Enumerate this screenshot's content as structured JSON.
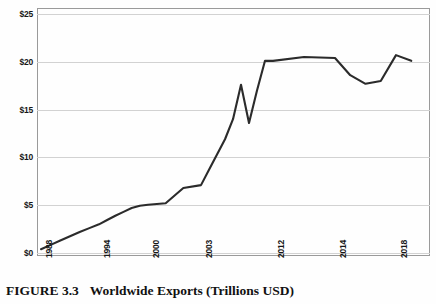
{
  "caption": {
    "figure_number": "FIGURE 3.3",
    "title": "Worldwide Exports (Trillions USD)"
  },
  "axes": {
    "y_ticks": [
      "$0",
      "$5",
      "$10",
      "$15",
      "$20",
      "$25"
    ],
    "x_ticks": [
      "1988",
      "1994",
      "2000",
      "2003",
      "2012",
      "2014",
      "2018"
    ]
  },
  "colors": {
    "line": "#2b2b2b",
    "grid": "#d2d2d2",
    "frame": "#9a9a9a",
    "text": "#161616",
    "background": "#fefefe"
  },
  "chart_data": {
    "type": "line",
    "title": "Worldwide Exports (Trillions USD)",
    "xlabel": "",
    "ylabel": "",
    "ylim": [
      0,
      25
    ],
    "xlim": [
      1988,
      2019
    ],
    "grid": true,
    "legend": false,
    "y_tick_values": [
      0,
      5,
      10,
      15,
      20,
      25
    ],
    "y_tick_labels": [
      "$0",
      "$5",
      "$10",
      "$15",
      "$20",
      "$25"
    ],
    "x_tick_values": [
      1988,
      1994,
      2000,
      2003,
      2012,
      2014,
      2018
    ],
    "x_tick_labels": [
      "1988",
      "1994",
      "2000",
      "2003",
      "2012",
      "2014",
      "2018"
    ],
    "series": [
      {
        "name": "Worldwide Exports",
        "x": [
          1988,
          1989,
          1990,
          1991,
          1992,
          1993,
          1994,
          1995,
          1996,
          1997,
          1998,
          1999,
          2000,
          2001,
          2002,
          2003,
          2004,
          2005,
          2006,
          2007,
          2008,
          2009,
          2010,
          2011,
          2012,
          2013,
          2014,
          2015,
          2016,
          2017,
          2018,
          2019
        ],
        "values": [
          0.4,
          0.85,
          1.3,
          1.75,
          2.2,
          2.6,
          3.0,
          3.45,
          3.9,
          4.3,
          4.7,
          4.95,
          5.05,
          5.2,
          6.8,
          7.1,
          8.7,
          10.3,
          11.9,
          14.0,
          17.6,
          13.6,
          17.0,
          20.1,
          20.1,
          20.5,
          20.4,
          18.6,
          17.7,
          18.0,
          20.7,
          20.1
        ]
      }
    ]
  }
}
